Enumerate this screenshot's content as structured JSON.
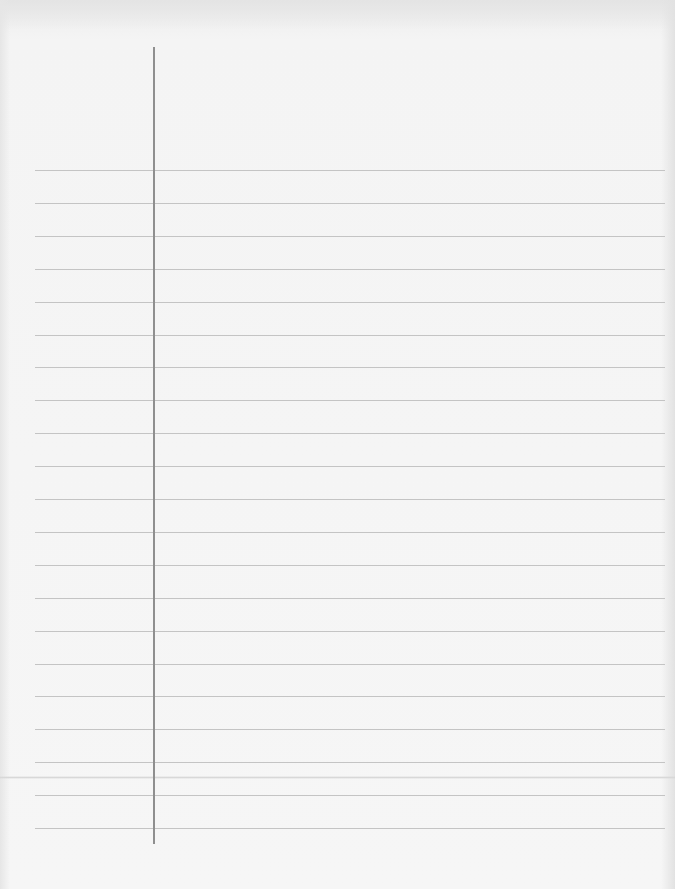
{
  "document": {
    "type": "blank lined paper",
    "content_text": "",
    "ruled_lines": {
      "count": 21,
      "first_y": 170,
      "spacing": 32.9,
      "x_start": 35,
      "x_end": 665,
      "color": "#c4c4c4"
    },
    "margin_line": {
      "x": 153,
      "y_start": 47,
      "y_end": 844,
      "color": "#8f8f8f"
    },
    "paper_color": "#f6f6f6"
  }
}
